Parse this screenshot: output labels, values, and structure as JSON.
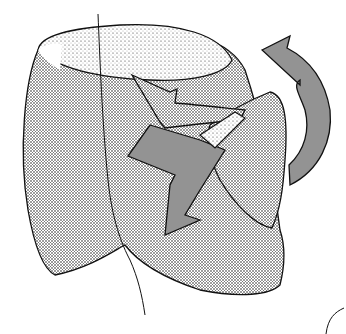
{
  "figure": {
    "colors": {
      "background": "#ffffff",
      "ink": "#111111",
      "stipple_dark": "#555555",
      "stipple_light": "#9a9a9a"
    },
    "elements": [
      "main-body",
      "top-rim",
      "inner-arrow",
      "lower-arrow",
      "folded-flap",
      "curved-rotation-arrow",
      "axis-line",
      "corner-curve"
    ]
  }
}
